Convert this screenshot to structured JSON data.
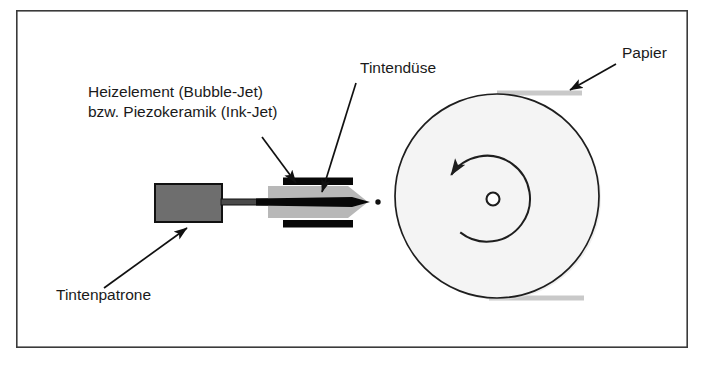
{
  "figure": {
    "type": "technical-diagram",
    "language": "de",
    "frame": {
      "x": 16,
      "y": 10,
      "width": 672,
      "height": 338,
      "stroke": "#3a3a3a",
      "fill": "#ffffff",
      "stroke_width": 1.6
    }
  },
  "colors": {
    "background": "#ffffff",
    "frame_stroke": "#3a3a3a",
    "text": "#1a1a1a",
    "leader_line": "#111111",
    "cartridge_fill": "#6e6e6e",
    "cartridge_stroke": "#111111",
    "nozzle_body_fill": "#b8b8b8",
    "nozzle_bar_fill": "#080808",
    "drum_fill": "#f4f4f4",
    "drum_stroke": "#1e1e1e",
    "paper_fill": "#c9c9c9",
    "droplet_fill": "#111111"
  },
  "labels": [
    {
      "id": "heater",
      "name": "heizelement-label",
      "lines": [
        "Heizelement (Bubble-Jet)",
        "bzw. Piezokeramik (Ink-Jet)"
      ],
      "x": 88,
      "y": 97,
      "anchor": "start",
      "font_size": 15.5
    },
    {
      "id": "nozzle",
      "name": "tintenduese-label",
      "lines": [
        "Tintendüse"
      ],
      "x": 360,
      "y": 73,
      "anchor": "start",
      "font_size": 15.5
    },
    {
      "id": "paper",
      "name": "papier-label",
      "lines": [
        "Papier"
      ],
      "x": 622,
      "y": 58,
      "anchor": "start",
      "font_size": 15.5
    },
    {
      "id": "cartridge",
      "name": "tintenpatrone-label",
      "lines": [
        "Tintenpatrone"
      ],
      "x": 56,
      "y": 300,
      "anchor": "start",
      "font_size": 15.5
    }
  ],
  "leaders": [
    {
      "id": "heater-leader",
      "name": "heizelement-leader-line",
      "from": [
        262,
        137
      ],
      "to": [
        296,
        184
      ],
      "arrow_at": "to"
    },
    {
      "id": "nozzle-leader",
      "name": "tintenduese-leader-line",
      "from": [
        356,
        83
      ],
      "to": [
        322,
        190
      ],
      "arrow_at": "to"
    },
    {
      "id": "paper-leader",
      "name": "papier-leader-line",
      "from": [
        616,
        64
      ],
      "to": [
        570,
        91
      ],
      "arrow_at": "to"
    },
    {
      "id": "cartridge-leader",
      "name": "tintenpatrone-leader-line",
      "from": [
        104,
        288
      ],
      "to": [
        186,
        229
      ],
      "arrow_at": "to"
    }
  ],
  "parts": {
    "cartridge": {
      "name": "ink-cartridge-body",
      "label": "Tintenpatrone",
      "x": 155,
      "y": 184,
      "width": 67,
      "height": 38
    },
    "feed_tube": {
      "name": "ink-feed-tube",
      "x": 222,
      "y": 199,
      "width": 50,
      "height": 6
    },
    "nozzle_body": {
      "name": "nozzle-body",
      "label": "Tintendüse",
      "left": 268,
      "right": 356,
      "tip": 368,
      "top": 186,
      "bottom": 218
    },
    "nozzle_center_bar": {
      "name": "nozzle-center-channel",
      "x": 258,
      "y": 197,
      "width": 96,
      "height": 9
    },
    "nozzle_top_bar": {
      "name": "heating-element-top",
      "x": 283,
      "y": 178,
      "width": 70,
      "height": 7
    },
    "nozzle_bottom_bar": {
      "name": "heating-element-bottom",
      "x": 283,
      "y": 220,
      "width": 70,
      "height": 7
    },
    "droplet": {
      "name": "ink-droplet",
      "cx": 378,
      "cy": 202,
      "r": 2.6
    },
    "drum": {
      "name": "paper-drum",
      "cx": 497,
      "cy": 196,
      "r": 102
    },
    "drum_hub": {
      "name": "drum-axle-hole",
      "cx": 493,
      "cy": 199,
      "r": 6.5
    },
    "rotation_arrow": {
      "name": "rotation-direction-arrow",
      "cx": 493,
      "cy": 199,
      "r": 43,
      "direction": "counterclockwise"
    },
    "paper_top": {
      "name": "paper-sheet-top",
      "x": 497,
      "y": 91,
      "width": 85,
      "height": 5
    },
    "paper_bottom": {
      "name": "paper-sheet-bottom",
      "x": 489,
      "y": 296,
      "width": 95,
      "height": 5
    }
  }
}
